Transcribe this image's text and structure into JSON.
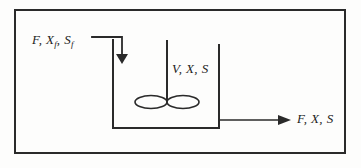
{
  "figure": {
    "type": "process-flow-diagram",
    "background_color": "#fdfdfc",
    "line_color": "#2a2a2a",
    "border": {
      "x": 14,
      "y": 9,
      "width": 331,
      "height": 144,
      "stroke_width": 2
    },
    "vessel": {
      "left_wall_x": 113,
      "right_wall_x": 219,
      "top_y": 40,
      "bottom_y": 128,
      "stroke_width": 2,
      "open_top": true
    },
    "shaft": {
      "x": 167,
      "top_y": 40,
      "bottom_y": 100,
      "stroke_width": 2
    },
    "impeller": {
      "center_y": 102,
      "blades": [
        {
          "cx": 151,
          "cy": 102,
          "rx": 16,
          "ry": 6.5
        },
        {
          "cx": 183,
          "cy": 102,
          "rx": 16,
          "ry": 6.5
        }
      ]
    },
    "inlet_stream": {
      "horizontal_y": 37,
      "from_x": 92,
      "to_x": 122,
      "vertical_x": 122,
      "arrow_tip_y": 62,
      "arrowhead": "filled-triangle-down"
    },
    "outlet_stream": {
      "y": 120,
      "from_x": 219,
      "to_x": 290,
      "arrowhead": "filled-triangle-right"
    }
  },
  "labels": {
    "feed": {
      "name": "feed-stream-label",
      "variables": [
        "F",
        "X",
        "S"
      ],
      "parts": [
        {
          "symbol": "F",
          "subscript": ""
        },
        {
          "symbol": "X",
          "subscript": "f"
        },
        {
          "symbol": "S",
          "subscript": "f"
        }
      ],
      "text_plain": "F, Xf, Sf",
      "meaning": "feed flow rate, feed biomass concentration, feed substrate concentration"
    },
    "holdup": {
      "name": "reactor-contents-label",
      "parts": [
        {
          "symbol": "V",
          "subscript": ""
        },
        {
          "symbol": "X",
          "subscript": ""
        },
        {
          "symbol": "S",
          "subscript": ""
        }
      ],
      "text_plain": "V, X, S",
      "meaning": "reactor volume, biomass concentration, substrate concentration"
    },
    "outlet": {
      "name": "outlet-stream-label",
      "parts": [
        {
          "symbol": "F",
          "subscript": ""
        },
        {
          "symbol": "X",
          "subscript": ""
        },
        {
          "symbol": "S",
          "subscript": ""
        }
      ],
      "text_plain": "F, X, S",
      "meaning": "effluent flow rate, biomass concentration, substrate concentration"
    }
  }
}
